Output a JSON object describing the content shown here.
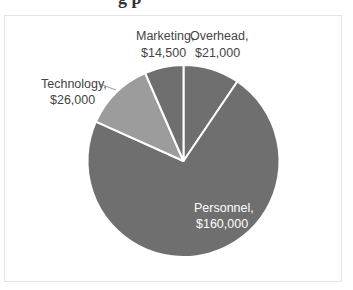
{
  "heading_fragment": "g p",
  "chart_data": {
    "type": "pie",
    "title": "",
    "start_angle_deg": 0,
    "direction": "clockwise",
    "slices": [
      {
        "label": "Overhead",
        "value": 21000,
        "display": "$21,000",
        "color": "#6f6f6f"
      },
      {
        "label": "Personnel",
        "value": 160000,
        "display": "$160,000",
        "color": "#6f6f6f"
      },
      {
        "label": "Technology",
        "value": 26000,
        "display": "$26,000",
        "color": "#9c9c9c"
      },
      {
        "label": "Marketing",
        "value": 14500,
        "display": "$14,500",
        "color": "#6f6f6f"
      }
    ],
    "total": 221500,
    "legend": "none",
    "label_format": "category, value"
  },
  "labels": {
    "overhead_name": "Overhead,",
    "overhead_value": "$21,000",
    "marketing_name": "Marketing,",
    "marketing_value": "$14,500",
    "technology_name": "Technology,",
    "technology_value": "$26,000",
    "personnel_name": "Personnel,",
    "personnel_value": "$160,000"
  },
  "colors": {
    "slice_dark": "#6f6f6f",
    "slice_light": "#9c9c9c",
    "separator": "#ffffff",
    "label_outside": "#444444",
    "label_inside": "#ffffff"
  }
}
